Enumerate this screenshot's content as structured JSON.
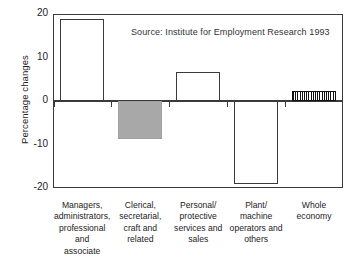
{
  "chart_data": {
    "type": "bar",
    "title": "",
    "subtitle": "",
    "xlabel": "",
    "ylabel": "Percentage changes",
    "ylim": [
      -20,
      20
    ],
    "yticks": [
      20,
      10,
      0,
      -10,
      -20
    ],
    "ytick_labels": [
      "20",
      "10",
      "0",
      "-10",
      "-20"
    ],
    "grid": false,
    "legend": "none",
    "annotation": "Source: Institute for Employment Research 1993",
    "zero_line": 0,
    "categories": [
      "Managers, administrators, professional and associate",
      "Clerical, secretarial, craft and related",
      "Personal/ protective services and sales",
      "Plant/ machine operators and others",
      "Whole economy"
    ],
    "category_lines": [
      [
        "Managers,",
        "administrators,",
        "professional and",
        "associate"
      ],
      [
        "Clerical,",
        "secretarial,",
        "craft and",
        "related"
      ],
      [
        "Personal/",
        "protective",
        "services and",
        "sales"
      ],
      [
        "Plant/",
        "machine",
        "operators and",
        "others"
      ],
      [
        "Whole",
        "economy"
      ]
    ],
    "values": [
      18.8,
      -8.7,
      6.7,
      -19.1,
      2.3
    ],
    "bar_styles": [
      "open",
      "gray",
      "open",
      "open",
      "hatch"
    ],
    "colors": {
      "open_fill": "#ffffff",
      "open_edge": "#3a3a3a",
      "gray_fill": "#a8a8a8",
      "hatch_fill": "#111111",
      "axis": "#3a3a3a",
      "text": "#222222",
      "background": "#ffffff"
    }
  },
  "axis": {
    "y_title": "Percentage changes",
    "ticks": [
      {
        "label": "20",
        "value": 20
      },
      {
        "label": "10",
        "value": 10
      },
      {
        "label": "0",
        "value": 0
      },
      {
        "label": "-10",
        "value": -10
      },
      {
        "label": "-20",
        "value": -20
      }
    ]
  },
  "note": {
    "source": "Source: Institute for Employment Research 1993"
  }
}
